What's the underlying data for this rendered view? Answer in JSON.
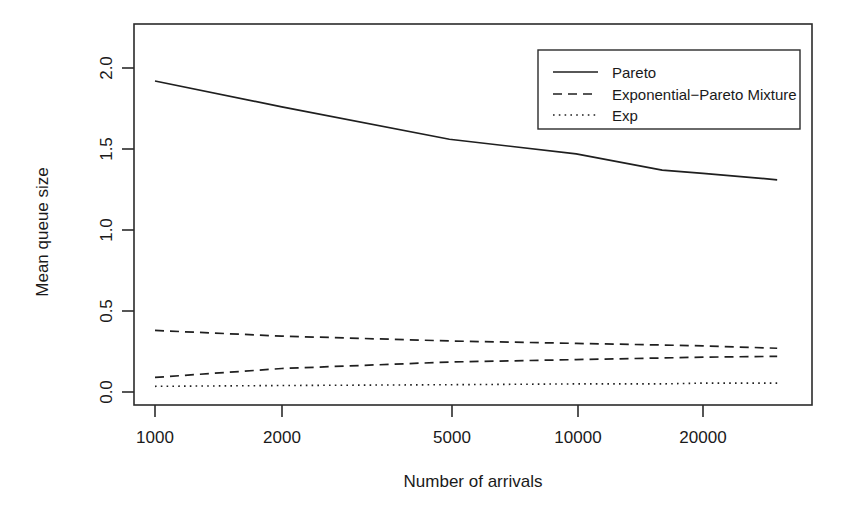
{
  "chart_data": {
    "type": "line",
    "title": "",
    "xlabel": "Number of arrivals",
    "ylabel": "Mean queue size",
    "xscale": "log",
    "xlim": [
      900,
      33000
    ],
    "ylim": [
      -0.05,
      2.25
    ],
    "grid": false,
    "legend_position": "top-right",
    "xticks": [
      1000,
      2000,
      5000,
      10000,
      20000
    ],
    "xticklabels": [
      "1000",
      "2000",
      "5000",
      "10000",
      "20000"
    ],
    "yticks": [
      0.0,
      0.5,
      1.0,
      1.5,
      2.0
    ],
    "yticklabels": [
      "0.0",
      "0.5",
      "1.0",
      "1.5",
      "2.0"
    ],
    "series": [
      {
        "name": "Pareto",
        "style": "solid",
        "x": [
          1000,
          2000,
          5000,
          10000,
          16000,
          20000,
          30000
        ],
        "values": [
          1.92,
          1.76,
          1.56,
          1.47,
          1.37,
          1.35,
          1.31
        ]
      },
      {
        "name": "Exponential-Pareto Mixture",
        "style": "dashed",
        "x": [
          1000,
          2000,
          5000,
          10000,
          16000,
          20000,
          30000
        ],
        "values": [
          0.38,
          0.345,
          0.315,
          0.3,
          0.29,
          0.285,
          0.27
        ]
      },
      {
        "name": "Exponential-Pareto Mixture (lower)",
        "style": "dashed",
        "x": [
          1000,
          2000,
          5000,
          10000,
          16000,
          20000,
          30000
        ],
        "values": [
          0.09,
          0.145,
          0.185,
          0.2,
          0.21,
          0.215,
          0.22
        ]
      },
      {
        "name": "Exp",
        "style": "dotted",
        "x": [
          1000,
          2000,
          5000,
          10000,
          16000,
          20000,
          30000
        ],
        "values": [
          0.035,
          0.04,
          0.045,
          0.05,
          0.05,
          0.055,
          0.055
        ]
      }
    ]
  },
  "legend": {
    "entries": [
      {
        "label": "Pareto",
        "style": "solid"
      },
      {
        "label": "Exponential−Pareto Mixture",
        "style": "dashed"
      },
      {
        "label": "Exp",
        "style": "dotted"
      }
    ]
  },
  "axes": {
    "x_title": "Number of arrivals",
    "y_title": "Mean queue size",
    "x_tick_labels": [
      "1000",
      "2000",
      "5000",
      "10000",
      "20000"
    ],
    "y_tick_labels": [
      "0.0",
      "0.5",
      "1.0",
      "1.5",
      "2.0"
    ]
  },
  "colors": {
    "ink": "#1f1f1f",
    "axis": "#2b2b2b",
    "background": "#ffffff"
  }
}
